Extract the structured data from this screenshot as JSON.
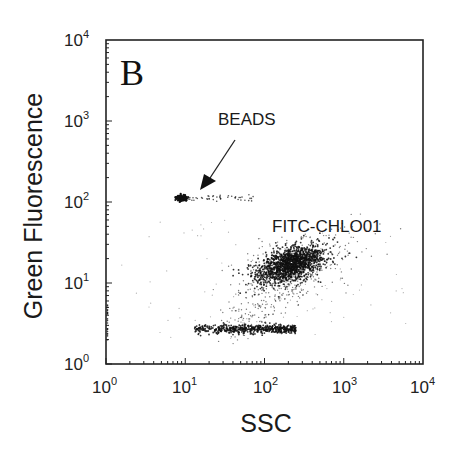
{
  "chart_data": {
    "type": "scatter",
    "title": "",
    "panel_label": "B",
    "xlabel": "SSC",
    "ylabel": "Green Fluorescence",
    "xscale": "log",
    "yscale": "log",
    "xlim": [
      1,
      10000
    ],
    "ylim": [
      1,
      10000
    ],
    "x_ticks": [
      {
        "base": "10",
        "exp": "0",
        "value": 1
      },
      {
        "base": "10",
        "exp": "1",
        "value": 10
      },
      {
        "base": "10",
        "exp": "2",
        "value": 100
      },
      {
        "base": "10",
        "exp": "3",
        "value": 1000
      },
      {
        "base": "10",
        "exp": "4",
        "value": 10000
      }
    ],
    "y_ticks": [
      {
        "base": "10",
        "exp": "0",
        "value": 1
      },
      {
        "base": "10",
        "exp": "1",
        "value": 10
      },
      {
        "base": "10",
        "exp": "2",
        "value": 100
      },
      {
        "base": "10",
        "exp": "3",
        "value": 1000
      },
      {
        "base": "10",
        "exp": "4",
        "value": 10000
      }
    ],
    "grid": false,
    "legend": null,
    "annotations": [
      {
        "text": "BEADS",
        "x": 30,
        "y": 700,
        "arrow_to": {
          "x": 12,
          "y": 130
        }
      },
      {
        "text": "FITC-CHLO01",
        "x": 130,
        "y": 40
      }
    ],
    "populations": [
      {
        "name": "BEADS",
        "center": {
          "x": 9,
          "y": 112
        },
        "x_range": [
          7,
          65
        ],
        "y_range": [
          95,
          130
        ],
        "shape": "tight cluster with horizontal tail to the right",
        "density": "high at head, sparse tail"
      },
      {
        "name": "FITC-CHLO01",
        "center": {
          "x": 210,
          "y": 17
        },
        "x_range": [
          60,
          1500
        ],
        "y_range": [
          6,
          40
        ],
        "shape": "dense elliptical cluster tilted upward to the right",
        "density": "very high"
      },
      {
        "name": "unlabeled/background band",
        "center": {
          "x": 50,
          "y": 2.7
        },
        "x_range": [
          13,
          250
        ],
        "y_range": [
          2.4,
          3.2
        ],
        "shape": "horizontal band",
        "density": "high"
      },
      {
        "name": "scattered events",
        "center": {
          "x": 100,
          "y": 5
        },
        "x_range": [
          1,
          1500
        ],
        "y_range": [
          2,
          60
        ],
        "shape": "diffuse scatter",
        "density": "low"
      }
    ]
  },
  "labels": {
    "panel": "B",
    "xlabel": "SSC",
    "ylabel": "Green Fluorescence",
    "beads": "BEADS",
    "fitc": "FITC-CHLO01",
    "x_ticks": [
      {
        "base": "10",
        "exp": "0"
      },
      {
        "base": "10",
        "exp": "1"
      },
      {
        "base": "10",
        "exp": "2"
      },
      {
        "base": "10",
        "exp": "3"
      },
      {
        "base": "10",
        "exp": "4"
      }
    ],
    "y_ticks": [
      {
        "base": "10",
        "exp": "0"
      },
      {
        "base": "10",
        "exp": "1"
      },
      {
        "base": "10",
        "exp": "2"
      },
      {
        "base": "10",
        "exp": "3"
      },
      {
        "base": "10",
        "exp": "4"
      }
    ]
  },
  "colors": {
    "background": "#ffffff",
    "frame": "#222222",
    "points": "#111111"
  }
}
